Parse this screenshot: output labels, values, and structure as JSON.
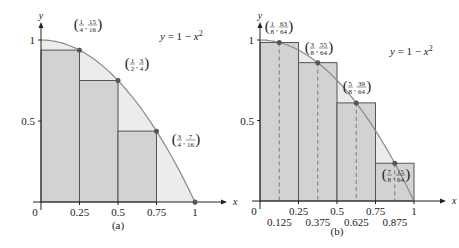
{
  "chart_data": [
    {
      "type": "bar",
      "panel_label": "(a)",
      "title": "",
      "function_label": "y = 1 − x²",
      "function": "1 - x^2",
      "xlabel": "x",
      "ylabel": "y",
      "xlim": [
        0,
        1
      ],
      "ylim": [
        0,
        1
      ],
      "x_ticks": [
        "0",
        "0.25",
        "0.5",
        "0.75",
        "1"
      ],
      "y_ticks": [
        "0.5",
        "1"
      ],
      "rectangles": [
        {
          "x0": 0,
          "x1": 0.25,
          "height": 0.9375
        },
        {
          "x0": 0.25,
          "x1": 0.5,
          "height": 0.75
        },
        {
          "x0": 0.5,
          "x1": 0.75,
          "height": 0.4375
        },
        {
          "x0": 0.75,
          "x1": 1,
          "height": 0
        }
      ],
      "points": [
        {
          "x": 0.25,
          "y": 0.9375,
          "label_x": "1/4",
          "label_y": "15/16"
        },
        {
          "x": 0.5,
          "y": 0.75,
          "label_x": "1/2",
          "label_y": "3/4"
        },
        {
          "x": 0.75,
          "y": 0.4375,
          "label_x": "3/4",
          "label_y": "7/16"
        },
        {
          "x": 1,
          "y": 0
        }
      ]
    },
    {
      "type": "bar",
      "panel_label": "(b)",
      "title": "",
      "function_label": "y = 1 − x²",
      "function": "1 - x^2",
      "xlabel": "x",
      "ylabel": "y",
      "xlim": [
        0,
        1
      ],
      "ylim": [
        0,
        1
      ],
      "x_ticks": [
        "0",
        "0.25",
        "0.5",
        "0.75",
        "1"
      ],
      "x_ticks_mid": [
        "0.125",
        "0.375",
        "0.625",
        "0.875"
      ],
      "y_ticks": [
        "0.5",
        "1"
      ],
      "rectangles": [
        {
          "x0": 0,
          "x1": 0.25,
          "height": 0.984375
        },
        {
          "x0": 0.25,
          "x1": 0.5,
          "height": 0.859375
        },
        {
          "x0": 0.5,
          "x1": 0.75,
          "height": 0.609375
        },
        {
          "x0": 0.75,
          "x1": 1,
          "height": 0.234375
        }
      ],
      "points": [
        {
          "x": 0.125,
          "y": 0.984375,
          "label_x": "1/8",
          "label_y": "63/64"
        },
        {
          "x": 0.375,
          "y": 0.859375,
          "label_x": "3/8",
          "label_y": "55/64"
        },
        {
          "x": 0.625,
          "y": 0.609375,
          "label_x": "5/8",
          "label_y": "39/64"
        },
        {
          "x": 0.875,
          "y": 0.234375,
          "label_x": "7/8",
          "label_y": "15/64"
        }
      ]
    }
  ],
  "colors": {
    "rect_fill": "#cfcfcf",
    "area_fill": "#ececec",
    "curve": "#8a8a8a",
    "rect_stroke": "#555555",
    "point": "#555555",
    "axis": "#222222"
  }
}
